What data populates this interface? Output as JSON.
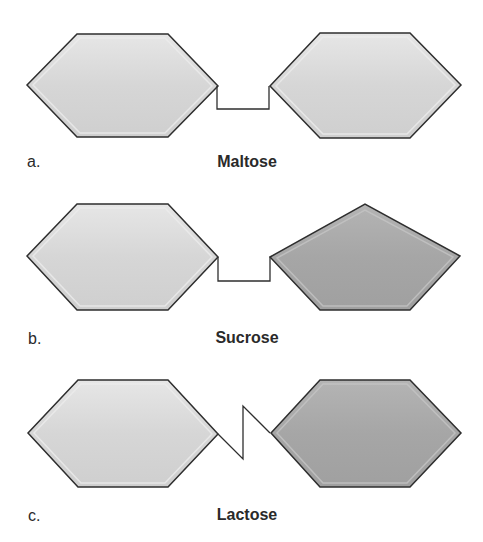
{
  "colors": {
    "background": "#ffffff",
    "outline": "#2e2e2e",
    "light_fill": "#d6d6d6",
    "light_highlight": "#ececec",
    "light_shadow": "#b8b8b8",
    "dark_fill": "#a6a6a6",
    "dark_highlight": "#c6c6c6",
    "dark_shadow": "#8a8a8a",
    "text": "#2a2a2a"
  },
  "panels": [
    {
      "letter": "a.",
      "name": "Maltose",
      "left_shape": {
        "type": "hexagon",
        "shade": "light"
      },
      "right_shape": {
        "type": "hexagon",
        "shade": "light"
      },
      "bond": "square-down"
    },
    {
      "letter": "b.",
      "name": "Sucrose",
      "left_shape": {
        "type": "hexagon",
        "shade": "light"
      },
      "right_shape": {
        "type": "pentagon",
        "shade": "dark"
      },
      "bond": "square-down"
    },
    {
      "letter": "c.",
      "name": "Lactose",
      "left_shape": {
        "type": "hexagon",
        "shade": "light"
      },
      "right_shape": {
        "type": "hexagon",
        "shade": "dark"
      },
      "bond": "zigzag"
    }
  ]
}
